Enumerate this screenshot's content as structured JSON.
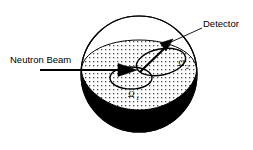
{
  "figure": {
    "width": 253,
    "height": 150,
    "background_color": "#ffffff",
    "stroke_color": "#000000",
    "fill_dark_color": "#000000",
    "hatch_color": "#333333"
  },
  "labels": {
    "neutron_beam": "Neutron Beam",
    "detector": "Detector",
    "omega1_symbol": "Ω",
    "omega1_subscript": "1",
    "omega2_symbol": "Ω",
    "omega2_subscript": "2"
  },
  "icons": {
    "beam_arrow": "beam-arrow-icon",
    "detector_arrow": "detector-arrow-icon",
    "sphere": "sphere-icon",
    "equator_disk": "equator-disk-icon",
    "solid_angle_1": "solid-angle-1-ellipse-icon",
    "solid_angle_2": "solid-angle-2-ellipse-icon",
    "leader_line": "detector-leader-line-icon"
  },
  "geometry": {
    "sphere_center_x": 139,
    "sphere_center_y": 74,
    "sphere_radius": 58,
    "equator_y": 70,
    "beam_start_x": 40,
    "beam_end_x": 136
  }
}
